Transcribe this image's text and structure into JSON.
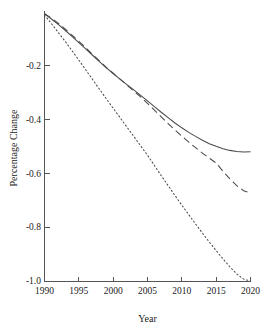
{
  "chart_data": {
    "type": "line",
    "title": "",
    "xlabel": "Year",
    "ylabel": "Percentage Change",
    "xlim": [
      1990,
      2020
    ],
    "ylim": [
      -1.0,
      0.0
    ],
    "grid": false,
    "legend_position": "none",
    "xticks": [
      1990,
      1995,
      2000,
      2005,
      2010,
      2015,
      2020
    ],
    "xtick_labels": [
      "1990",
      "1995",
      "2000",
      "2005",
      "2010",
      "2015",
      "2020"
    ],
    "yticks": [
      -0.2,
      -0.4,
      -0.6,
      -0.8,
      -1.0
    ],
    "ytick_labels": [
      "-0.2",
      "-0.4",
      "-0.6",
      "-0.8",
      "-1.0"
    ],
    "x": [
      1990,
      1991,
      1992,
      1993,
      1994,
      1995,
      1996,
      1997,
      1998,
      1999,
      2000,
      2001,
      2002,
      2003,
      2004,
      2005,
      2006,
      2007,
      2008,
      2009,
      2010,
      2011,
      2012,
      2013,
      2014,
      2015,
      2016,
      2017,
      2018,
      2019,
      2020
    ],
    "series": [
      {
        "name": "solid-series",
        "style": "solid",
        "color": "#4a4a4a",
        "values": [
          -0.005,
          -0.025,
          -0.045,
          -0.067,
          -0.09,
          -0.113,
          -0.136,
          -0.16,
          -0.184,
          -0.207,
          -0.228,
          -0.249,
          -0.269,
          -0.289,
          -0.309,
          -0.33,
          -0.351,
          -0.372,
          -0.392,
          -0.412,
          -0.43,
          -0.447,
          -0.462,
          -0.476,
          -0.489,
          -0.499,
          -0.508,
          -0.514,
          -0.518,
          -0.52,
          -0.519
        ]
      },
      {
        "name": "dashed-series",
        "style": "dashed",
        "color": "#4a4a4a",
        "values": [
          -0.005,
          -0.022,
          -0.041,
          -0.062,
          -0.085,
          -0.108,
          -0.132,
          -0.157,
          -0.181,
          -0.205,
          -0.227,
          -0.249,
          -0.271,
          -0.293,
          -0.315,
          -0.339,
          -0.364,
          -0.389,
          -0.414,
          -0.438,
          -0.461,
          -0.483,
          -0.504,
          -0.524,
          -0.543,
          -0.561,
          -0.592,
          -0.62,
          -0.645,
          -0.664,
          -0.672
        ]
      },
      {
        "name": "dotted-series",
        "style": "dotted",
        "color": "#4a4a4a",
        "values": [
          -0.01,
          -0.042,
          -0.075,
          -0.108,
          -0.143,
          -0.178,
          -0.214,
          -0.25,
          -0.286,
          -0.322,
          -0.357,
          -0.392,
          -0.427,
          -0.462,
          -0.497,
          -0.532,
          -0.57,
          -0.608,
          -0.645,
          -0.682,
          -0.718,
          -0.753,
          -0.788,
          -0.822,
          -0.855,
          -0.887,
          -0.918,
          -0.947,
          -0.974,
          -0.993,
          -1.0
        ]
      }
    ]
  },
  "axes": {
    "x_axis_name": "x-axis",
    "y_axis_name": "y-axis"
  }
}
